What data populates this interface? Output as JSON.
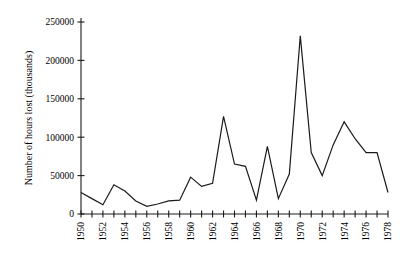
{
  "chart_data": {
    "type": "line",
    "title": "",
    "subtitle": "",
    "xlabel": "",
    "ylabel": "Number of hours lost (thousands)",
    "x": [
      1950,
      1951,
      1952,
      1953,
      1954,
      1955,
      1956,
      1957,
      1958,
      1959,
      1960,
      1961,
      1962,
      1963,
      1964,
      1965,
      1966,
      1967,
      1968,
      1969,
      1970,
      1971,
      1972,
      1973,
      1974,
      1975,
      1976,
      1977,
      1978
    ],
    "values": [
      28000,
      20000,
      12000,
      38000,
      30000,
      17000,
      10000,
      13000,
      17000,
      18000,
      48000,
      36000,
      40000,
      127000,
      65000,
      62000,
      18000,
      88000,
      20000,
      52000,
      232000,
      80000,
      50000,
      90000,
      120000,
      98000,
      80000,
      80000,
      28000
    ],
    "series": [
      {
        "name": "Number of hours lost",
        "values": [
          28000,
          20000,
          12000,
          38000,
          30000,
          17000,
          10000,
          13000,
          17000,
          18000,
          48000,
          36000,
          40000,
          127000,
          65000,
          62000,
          18000,
          88000,
          20000,
          52000,
          232000,
          80000,
          50000,
          90000,
          120000,
          98000,
          80000,
          80000,
          28000
        ],
        "color": "#1a1a1a"
      }
    ],
    "xlim": [
      1950,
      1978
    ],
    "ylim": [
      0,
      250000
    ],
    "ytick_values": [
      0,
      50000,
      100000,
      150000,
      200000,
      250000
    ],
    "ytick_labels": [
      "0",
      "50000",
      "100000",
      "150000",
      "200000",
      "250000"
    ],
    "xtick_values": [
      1950,
      1951,
      1952,
      1953,
      1954,
      1955,
      1956,
      1957,
      1958,
      1959,
      1960,
      1961,
      1962,
      1963,
      1964,
      1965,
      1966,
      1967,
      1968,
      1969,
      1970,
      1971,
      1972,
      1973,
      1974,
      1975,
      1976,
      1977,
      1978
    ],
    "xtick_labels_shown": [
      "1950",
      "1952",
      "1954",
      "1956",
      "1958",
      "1960",
      "1962",
      "1964",
      "1966",
      "1968",
      "1970",
      "1972",
      "1974",
      "1976",
      "1978"
    ],
    "xtick_label_rotation": -90,
    "grid": false,
    "legend": false,
    "legend_position": "none",
    "line_color": "#1a1a1a",
    "line_width": 1.2,
    "axis_color": "#1a1a1a",
    "background_color": "#ffffff",
    "markers": false
  }
}
